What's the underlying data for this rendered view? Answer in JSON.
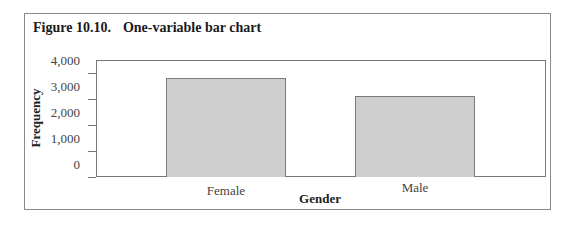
{
  "figure": {
    "number": "Figure 10.10.",
    "title": "One-variable bar chart"
  },
  "chart_data": {
    "type": "bar",
    "title": "One-variable bar chart",
    "categories": [
      "Female",
      "Male"
    ],
    "values": [
      3800,
      3100
    ],
    "xlabel": "Gender",
    "ylabel": "Frequency",
    "ylim": [
      0,
      4000
    ],
    "yticks": [
      0,
      1000,
      2000,
      3000,
      4000
    ],
    "ytick_labels": [
      "0",
      "1,000",
      "2,000",
      "3,000",
      "4,000"
    ],
    "grid": false,
    "legend": null,
    "bar_color": "#cfcfcf"
  }
}
